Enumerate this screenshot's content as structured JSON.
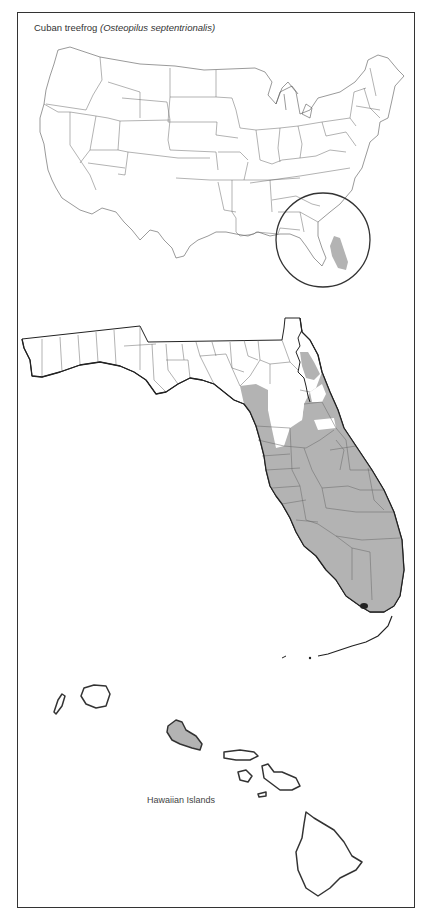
{
  "figure": {
    "title_common": "Cuban treefrog",
    "title_scientific": "(Osteopilus septentrionalis)",
    "panels": [
      {
        "name": "United States overview",
        "highlight": "Florida (circled)"
      },
      {
        "name": "Florida counties",
        "shading": "gray = present"
      },
      {
        "name": "Hawaiian Islands",
        "label": "Hawaiian Islands"
      }
    ],
    "hawaii_label": "Hawaiian Islands",
    "colors": {
      "present_fill": "#b3b3b3",
      "absent_fill": "#ffffff",
      "outline": "#333333",
      "frame": "#333333"
    },
    "florida_present_regions": [
      "Northeast Atlantic coast",
      "Central peninsula",
      "Gulf coast peninsula",
      "South Florida",
      "Florida Keys"
    ],
    "hawaii_present_islands": [
      "Oahu"
    ]
  }
}
